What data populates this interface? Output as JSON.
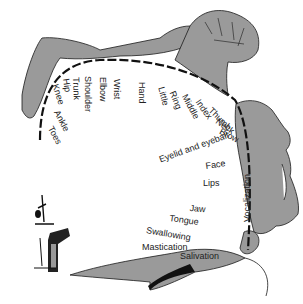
{
  "diagram": {
    "body_labels": [
      {
        "text": "Toes",
        "x": 54,
        "y": 125,
        "rot": 62
      },
      {
        "text": "Ankle",
        "x": 60,
        "y": 109,
        "rot": 62
      },
      {
        "text": "Knee",
        "x": 59,
        "y": 83,
        "rot": 72
      },
      {
        "text": "Hip",
        "x": 70,
        "y": 78,
        "rot": 82
      },
      {
        "text": "Trunk",
        "x": 80,
        "y": 77,
        "rot": 88
      },
      {
        "text": "Shoulder",
        "x": 92,
        "y": 76,
        "rot": 90
      },
      {
        "text": "Elbow",
        "x": 107,
        "y": 77,
        "rot": 90
      },
      {
        "text": "Wrist",
        "x": 121,
        "y": 79,
        "rot": 90
      },
      {
        "text": "Hand",
        "x": 146,
        "y": 82,
        "rot": 90
      },
      {
        "text": "Little",
        "x": 165,
        "y": 86,
        "rot": 75
      },
      {
        "text": "Ring",
        "x": 176,
        "y": 90,
        "rot": 68
      },
      {
        "text": "Middle",
        "x": 188,
        "y": 93,
        "rot": 62
      },
      {
        "text": "Index",
        "x": 201,
        "y": 98,
        "rot": 55
      },
      {
        "text": "Thumb",
        "x": 213,
        "y": 106,
        "rot": 45
      },
      {
        "text": "Neck",
        "x": 219,
        "y": 117,
        "rot": 35
      },
      {
        "text": "Brow",
        "x": 222,
        "y": 127,
        "rot": 28
      }
    ],
    "face_labels": [
      {
        "text": "Eyelid and eyeball",
        "x": 158,
        "y": 156,
        "rot": -20
      },
      {
        "text": "Face",
        "x": 205,
        "y": 162,
        "rot": -8
      },
      {
        "text": "Lips",
        "x": 203,
        "y": 179,
        "rot": 0
      },
      {
        "text": "Jaw",
        "x": 190,
        "y": 204,
        "rot": 5
      },
      {
        "text": "Tongue",
        "x": 170,
        "y": 214,
        "rot": 8
      },
      {
        "text": "Swallowing",
        "x": 147,
        "y": 226,
        "rot": 10
      },
      {
        "text": "Mastication",
        "x": 142,
        "y": 243,
        "rot": 0
      },
      {
        "text": "Salivation",
        "x": 180,
        "y": 252,
        "rot": 0
      }
    ],
    "vertical_label": {
      "text": "Vocalization",
      "x": 243,
      "y": 222,
      "rot": -90
    },
    "colors": {
      "fill": "#9a9a9a",
      "stroke": "#1a1a1a",
      "background": "#ffffff"
    }
  }
}
